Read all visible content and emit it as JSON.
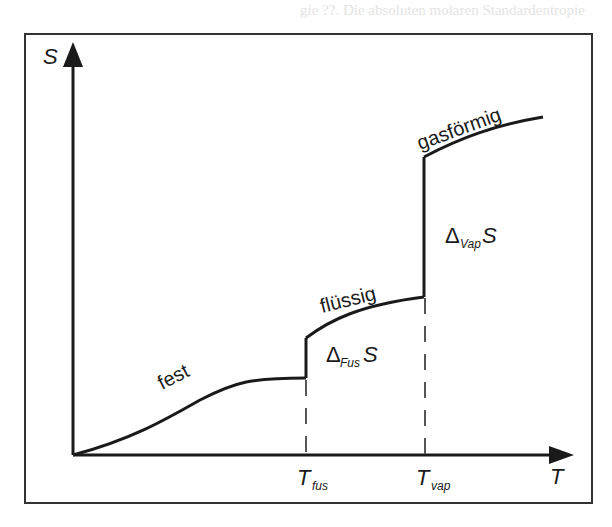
{
  "background_text": {
    "line1": "gie ??. Die absoluten molaren Standardentropie",
    "line2": "von allen Stoffen im Index ... Standardzustand",
    "line3": "... und (7.?)",
    "line4": "... (K) ..."
  },
  "diagram": {
    "y_axis_label": "S",
    "x_axis_label": "T",
    "phases": {
      "solid": "fest",
      "liquid": "flüssig",
      "gas": "gasförmig"
    },
    "transitions": {
      "fusion": {
        "delta": "Δ",
        "subscript": "Fus",
        "symbol": "S"
      },
      "vaporization": {
        "delta": "Δ",
        "subscript": "Vap",
        "symbol": "S"
      }
    },
    "temperatures": {
      "fusion": {
        "symbol": "T",
        "subscript": "fus"
      },
      "vaporization": {
        "symbol": "T",
        "subscript": "vap"
      }
    }
  },
  "colors": {
    "ink": "#1a1a1a",
    "frame": "#333333",
    "dashed": "#555555",
    "background": "#ffffff"
  }
}
